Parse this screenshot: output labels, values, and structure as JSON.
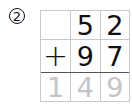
{
  "problem": {
    "number_label": "2",
    "rows": [
      {
        "cells": [
          "",
          "5",
          "2"
        ]
      },
      {
        "cells": [
          "+",
          "9",
          "7"
        ]
      },
      {
        "cells": [
          "1",
          "4",
          "9"
        ]
      }
    ],
    "operand_top": "52",
    "operand_bottom": "97",
    "operator": "+",
    "answer": "149",
    "answer_color": "#c4c4c4"
  }
}
